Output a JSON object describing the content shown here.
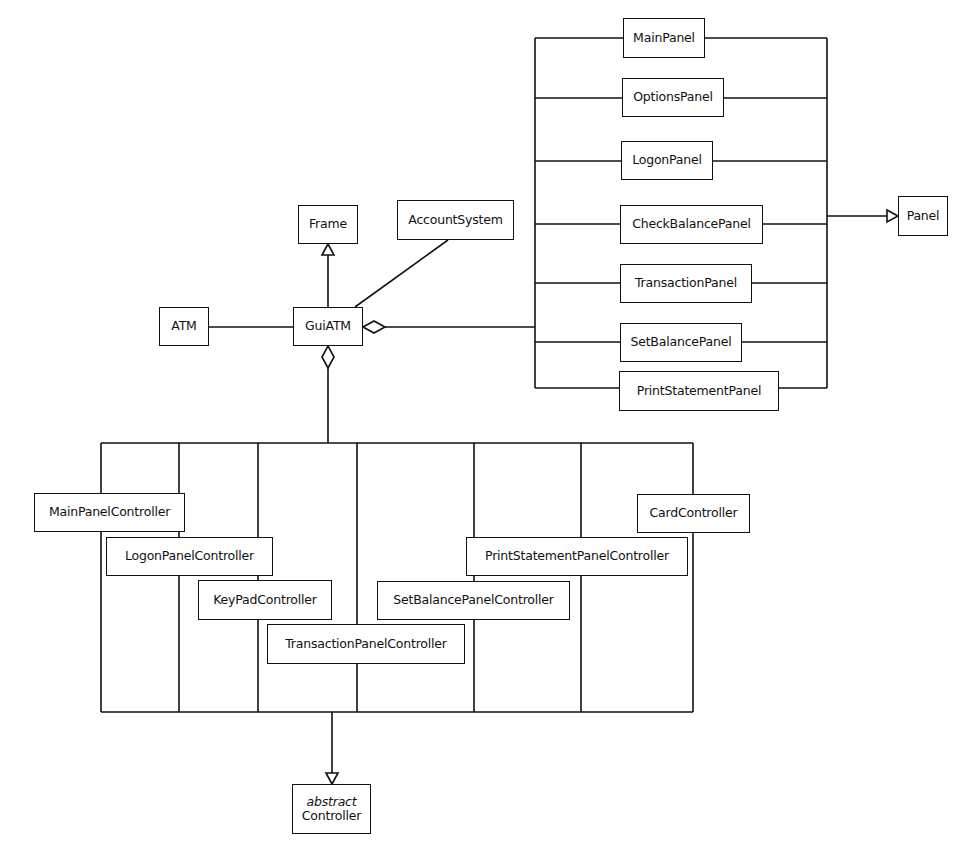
{
  "diagram": {
    "type": "UML class diagram",
    "classes": {
      "main_panel": "MainPanel",
      "options_panel": "OptionsPanel",
      "logon_panel": "LogonPanel",
      "check_balance_panel": "CheckBalancePanel",
      "transaction_panel": "TransactionPanel",
      "set_balance_panel": "SetBalancePanel",
      "print_statement_panel": "PrintStatementPanel",
      "panel": "Panel",
      "frame": "Frame",
      "account_system": "AccountSystem",
      "atm": "ATM",
      "gui_atm": "GuiATM",
      "main_panel_controller": "MainPanelController",
      "logon_panel_controller": "LogonPanelController",
      "keypad_controller": "KeyPadController",
      "transaction_panel_controller": "TransactionPanelController",
      "set_balance_panel_controller": "SetBalancePanelController",
      "print_statement_panel_controller": "PrintStatementPanelController",
      "card_controller": "CardController",
      "controller": {
        "stereotype": "abstract",
        "name": "Controller"
      }
    },
    "relationships": [
      {
        "from": "GuiATM",
        "to": "Frame",
        "kind": "generalization"
      },
      {
        "from": "GuiATM",
        "to": "AccountSystem",
        "kind": "association"
      },
      {
        "from": "ATM",
        "to": "GuiATM",
        "kind": "association"
      },
      {
        "from": "GuiATM",
        "to": "Panels",
        "kind": "aggregation"
      },
      {
        "from": "GuiATM",
        "to": "Controllers",
        "kind": "aggregation"
      },
      {
        "from": "Panels",
        "to": "Panel",
        "kind": "generalization"
      },
      {
        "from": "Controllers",
        "to": "Controller",
        "kind": "generalization"
      }
    ]
  }
}
